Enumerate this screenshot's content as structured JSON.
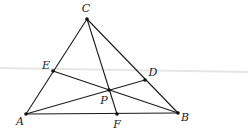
{
  "diagram": {
    "points": [
      {
        "id": "A",
        "label": "A"
      },
      {
        "id": "B",
        "label": "B"
      },
      {
        "id": "C",
        "label": "C"
      },
      {
        "id": "D",
        "label": "D"
      },
      {
        "id": "E",
        "label": "E"
      },
      {
        "id": "F",
        "label": "F"
      },
      {
        "id": "P",
        "label": "P"
      }
    ],
    "segments": [
      {
        "from": "A",
        "to": "B"
      },
      {
        "from": "B",
        "to": "C"
      },
      {
        "from": "C",
        "to": "A"
      },
      {
        "from": "A",
        "to": "D"
      },
      {
        "from": "B",
        "to": "E"
      },
      {
        "from": "C",
        "to": "F"
      }
    ],
    "relations": [
      "D lies on BC",
      "E lies on CA",
      "F lies on AB",
      "AD, BE, CF meet at P"
    ]
  }
}
